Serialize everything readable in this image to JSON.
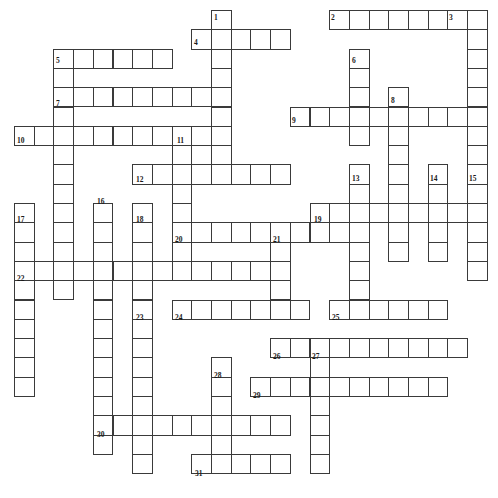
{
  "puzzle": {
    "title": "Crossword Puzzle Grid",
    "type": "crossword",
    "width_px": 498,
    "height_px": 498,
    "cell_width_px": 19.7,
    "cell_height_px": 19.3,
    "origin_x_px": 14,
    "origin_y_px": 10,
    "cell_fill_color": "#ffffff",
    "cell_border_color": "#3a3a3a",
    "background_color": "#ffffff",
    "number_color": "#1a1a1a",
    "columns": 25,
    "rows": 25,
    "entries": [
      {
        "number": "1",
        "direction": "down",
        "col": 10,
        "row": 0,
        "length": 8
      },
      {
        "number": "2",
        "direction": "across",
        "col": 16,
        "row": 0,
        "length": 8
      },
      {
        "number": "3",
        "direction": "down",
        "col": 23,
        "row": 0,
        "length": 8
      },
      {
        "number": "4",
        "direction": "across",
        "col": 9,
        "row": 1,
        "length": 5
      },
      {
        "number": "5",
        "direction": "across",
        "col": 2,
        "row": 2,
        "length": 6
      },
      {
        "number": "5b",
        "direction": "down",
        "col": 2,
        "row": 2,
        "length": 13
      },
      {
        "number": "6",
        "direction": "down",
        "col": 17,
        "row": 2,
        "length": 5
      },
      {
        "number": "7",
        "direction": "across",
        "col": 2,
        "row": 4,
        "length": 9
      },
      {
        "number": "8",
        "direction": "down",
        "col": 19,
        "row": 4,
        "length": 9
      },
      {
        "number": "9",
        "direction": "across",
        "col": 14,
        "row": 5,
        "length": 9
      },
      {
        "number": "10",
        "direction": "across",
        "col": 0,
        "row": 6,
        "length": 11
      },
      {
        "number": "11",
        "direction": "down",
        "col": 8,
        "row": 6,
        "length": 7
      },
      {
        "number": "12",
        "direction": "across",
        "col": 6,
        "row": 8,
        "length": 8
      },
      {
        "number": "13",
        "direction": "down",
        "col": 17,
        "row": 8,
        "length": 8
      },
      {
        "number": "14",
        "direction": "down",
        "col": 21,
        "row": 8,
        "length": 5
      },
      {
        "number": "15",
        "direction": "down",
        "col": 23,
        "row": 8,
        "length": 6
      },
      {
        "number": "16",
        "direction": "down",
        "col": 4,
        "row": 10,
        "length": 13
      },
      {
        "number": "17",
        "direction": "down",
        "col": 0,
        "row": 10,
        "length": 10
      },
      {
        "number": "18",
        "direction": "down",
        "col": 6,
        "row": 10,
        "length": 9
      },
      {
        "number": "19",
        "direction": "across",
        "col": 15,
        "row": 10,
        "length": 9
      },
      {
        "number": "20",
        "direction": "across",
        "col": 8,
        "row": 11,
        "length": 9
      },
      {
        "number": "21",
        "direction": "down",
        "col": 13,
        "row": 11,
        "length": 4
      },
      {
        "number": "22",
        "direction": "across",
        "col": 0,
        "row": 13,
        "length": 14
      },
      {
        "number": "23",
        "direction": "down",
        "col": 6,
        "row": 15,
        "length": 9
      },
      {
        "number": "24",
        "direction": "across",
        "col": 8,
        "row": 15,
        "length": 7
      },
      {
        "number": "25",
        "direction": "across",
        "col": 16,
        "row": 15,
        "length": 6
      },
      {
        "number": "26",
        "direction": "across",
        "col": 13,
        "row": 17,
        "length": 10
      },
      {
        "number": "27",
        "direction": "down",
        "col": 15,
        "row": 17,
        "length": 7
      },
      {
        "number": "28",
        "direction": "down",
        "col": 10,
        "row": 18,
        "length": 6
      },
      {
        "number": "29",
        "direction": "across",
        "col": 12,
        "row": 19,
        "length": 10
      },
      {
        "number": "30",
        "direction": "across",
        "col": 4,
        "row": 21,
        "length": 10
      },
      {
        "number": "31",
        "direction": "across",
        "col": 9,
        "row": 23,
        "length": 5
      }
    ],
    "numbered_labels": [
      {
        "label": "1",
        "x": 213,
        "y": 13
      },
      {
        "label": "2",
        "x": 330,
        "y": 13
      },
      {
        "label": "3",
        "x": 448,
        "y": 13
      },
      {
        "label": "4",
        "x": 193,
        "y": 38
      },
      {
        "label": "5",
        "x": 55,
        "y": 56
      },
      {
        "label": "6",
        "x": 351,
        "y": 56
      },
      {
        "label": "7",
        "x": 55,
        "y": 99
      },
      {
        "label": "8",
        "x": 390,
        "y": 96
      },
      {
        "label": "9",
        "x": 291,
        "y": 116
      },
      {
        "label": "10",
        "x": 16,
        "y": 136
      },
      {
        "label": "11",
        "x": 176,
        "y": 136
      },
      {
        "label": "12",
        "x": 135,
        "y": 175
      },
      {
        "label": "13",
        "x": 351,
        "y": 174
      },
      {
        "label": "14",
        "x": 429,
        "y": 174
      },
      {
        "label": "15",
        "x": 468,
        "y": 174
      },
      {
        "label": "16",
        "x": 96,
        "y": 197
      },
      {
        "label": "17",
        "x": 16,
        "y": 215
      },
      {
        "label": "18",
        "x": 135,
        "y": 215
      },
      {
        "label": "19",
        "x": 313,
        "y": 215
      },
      {
        "label": "20",
        "x": 174,
        "y": 235
      },
      {
        "label": "21",
        "x": 272,
        "y": 235
      },
      {
        "label": "22",
        "x": 16,
        "y": 274
      },
      {
        "label": "23",
        "x": 135,
        "y": 313
      },
      {
        "label": "24",
        "x": 174,
        "y": 313
      },
      {
        "label": "25",
        "x": 331,
        "y": 313
      },
      {
        "label": "26",
        "x": 272,
        "y": 352
      },
      {
        "label": "27",
        "x": 311,
        "y": 352
      },
      {
        "label": "28",
        "x": 213,
        "y": 371
      },
      {
        "label": "29",
        "x": 252,
        "y": 391
      },
      {
        "label": "30",
        "x": 96,
        "y": 430
      },
      {
        "label": "31",
        "x": 194,
        "y": 469
      }
    ]
  }
}
